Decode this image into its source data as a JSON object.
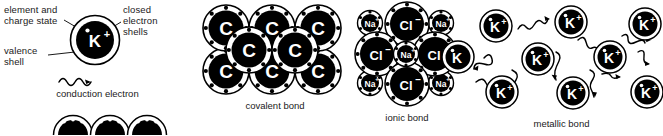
{
  "figure": {
    "background_color": "#ffffff",
    "line_color": "#000000",
    "text_color": "#1a1a1a",
    "width": 663,
    "height": 135
  },
  "legend": {
    "annotations": [
      {
        "id": "element-charge",
        "line1": "element and",
        "line2": "charge state"
      },
      {
        "id": "closed-shells",
        "line1": "closed",
        "line2": "electron",
        "line3": "shells"
      },
      {
        "id": "valence-shell",
        "line1": "valence",
        "line2": "shell"
      }
    ],
    "conduction_label": "conduction  electron",
    "atom": {
      "symbol": "K",
      "charge": "+",
      "label": "K+"
    }
  },
  "panels": [
    {
      "id": "covalent",
      "caption": "covalent bond",
      "atom_label": "C",
      "atom_symbol": "C",
      "atom_charge": "",
      "atom_count": 8,
      "shell_electrons": 8
    },
    {
      "id": "ionic",
      "caption": "ionic bond",
      "anion": {
        "symbol": "Cl",
        "charge": "–",
        "label": "Cl–",
        "count": 4
      },
      "cation": {
        "symbol": "Na",
        "charge": "+",
        "label": "Na+",
        "count": 5
      }
    },
    {
      "id": "metallic",
      "caption": "metallic bond",
      "atom_label": "K+",
      "atom_symbol": "K",
      "atom_charge": "+",
      "atom_count": 9,
      "free_electron_count": 12
    }
  ],
  "bottom_row": {
    "id": "cut-off-atom-row",
    "atom_count": 3,
    "note_visible": false
  }
}
